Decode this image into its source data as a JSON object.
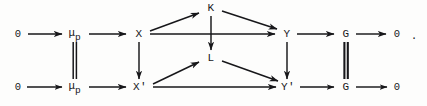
{
  "figure": {
    "kind": "commutative-diagram",
    "ink_color": "#17171a",
    "background_color": "#fdfdfc",
    "trailing_punctuation": "."
  },
  "nodes": {
    "top_row": [
      {
        "id": "zero-top-left",
        "label": "0",
        "x": 18,
        "y": 34
      },
      {
        "id": "mu-p-top",
        "label": "μ",
        "sub": "p",
        "x": 75,
        "y": 33
      },
      {
        "id": "X",
        "label": "X",
        "x": 139,
        "y": 34
      },
      {
        "id": "K",
        "label": "K",
        "x": 211,
        "y": 8
      },
      {
        "id": "Y",
        "label": "Y",
        "x": 287,
        "y": 34
      },
      {
        "id": "G-top",
        "label": "G",
        "x": 346,
        "y": 34
      },
      {
        "id": "zero-top-right",
        "label": "0",
        "x": 397,
        "y": 34
      }
    ],
    "bottom_row": [
      {
        "id": "zero-bottom-left",
        "label": "0",
        "x": 18,
        "y": 87
      },
      {
        "id": "mu-p-bottom",
        "label": "μ",
        "sub": "p",
        "x": 75,
        "y": 86
      },
      {
        "id": "X-prime",
        "label": "X'",
        "x": 140,
        "y": 87
      },
      {
        "id": "L",
        "label": "L",
        "x": 211,
        "y": 58
      },
      {
        "id": "Y-prime",
        "label": "Y'",
        "x": 288,
        "y": 87
      },
      {
        "id": "G-bottom",
        "label": "G",
        "x": 346,
        "y": 87
      },
      {
        "id": "zero-bottom-right",
        "label": "0",
        "x": 397,
        "y": 87
      }
    ]
  },
  "edges": {
    "top_row_horizontal": [
      {
        "id": "zero-to-mu-top",
        "from": "0",
        "to": "μ_p",
        "style": "arrow"
      },
      {
        "id": "mu-to-X",
        "from": "μ_p",
        "to": "X",
        "style": "arrow"
      },
      {
        "id": "X-to-Y",
        "from": "X",
        "to": "Y",
        "style": "arrow"
      },
      {
        "id": "Y-to-G-top",
        "from": "Y",
        "to": "G",
        "style": "arrow"
      },
      {
        "id": "G-to-zero-top",
        "from": "G",
        "to": "0",
        "style": "arrow"
      }
    ],
    "bottom_row_horizontal": [
      {
        "id": "zero-to-mu-bottom",
        "from": "0",
        "to": "μ_p",
        "style": "arrow"
      },
      {
        "id": "mu-to-Xprime",
        "from": "μ_p",
        "to": "X'",
        "style": "arrow"
      },
      {
        "id": "Xprime-to-Yprime",
        "from": "X'",
        "to": "Y'",
        "style": "arrow"
      },
      {
        "id": "Yprime-to-G-bottom",
        "from": "Y'",
        "to": "G",
        "style": "arrow"
      },
      {
        "id": "G-to-zero-bottom",
        "from": "G",
        "to": "0",
        "style": "arrow"
      }
    ],
    "vertical": [
      {
        "id": "mu-equals-mu",
        "from": "μ_p",
        "to": "μ_p",
        "style": "double-bar-equality"
      },
      {
        "id": "X-to-Xprime",
        "from": "X",
        "to": "X'",
        "style": "arrow"
      },
      {
        "id": "K-to-L",
        "from": "K",
        "to": "L",
        "style": "arrow"
      },
      {
        "id": "Y-to-Yprime",
        "from": "Y",
        "to": "Y'",
        "style": "arrow"
      },
      {
        "id": "G-equals-G",
        "from": "G",
        "to": "G",
        "style": "double-bar-equality"
      }
    ],
    "diagonal": [
      {
        "id": "X-to-K",
        "from": "X",
        "to": "K",
        "style": "arrow"
      },
      {
        "id": "K-to-Y",
        "from": "K",
        "to": "Y",
        "style": "arrow"
      },
      {
        "id": "Xprime-to-L",
        "from": "X'",
        "to": "L",
        "style": "arrow"
      },
      {
        "id": "L-to-Yprime",
        "from": "L",
        "to": "Y'",
        "style": "arrow"
      }
    ]
  }
}
